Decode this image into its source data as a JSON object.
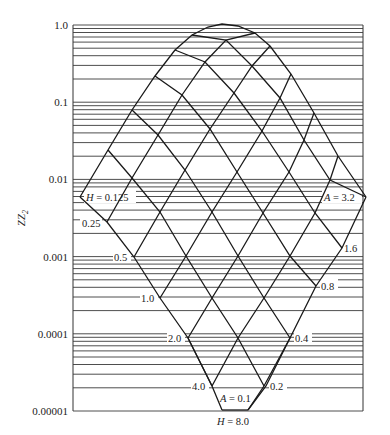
{
  "chart_data": {
    "type": "line",
    "title": "",
    "xlabel": "",
    "ylabel": "ZZ₂",
    "yscale": "log",
    "ylim": [
      1e-05,
      1.0
    ],
    "grid": true,
    "y_ticks": [
      "1.0",
      "0.1",
      "0.01",
      "0.001",
      "0.0001",
      "0.00001"
    ],
    "H_labels": [
      "H = 0.125",
      "0.25",
      "0.5",
      "1.0",
      "2.0",
      "4.0",
      "H = 8.0"
    ],
    "A_labels": [
      "A = 3.2",
      "1.6",
      "0.8",
      "0.4",
      "0.2",
      "A = 0.1"
    ],
    "families": [
      {
        "name": "H",
        "values": [
          0.125,
          0.25,
          0.5,
          1.0,
          2.0,
          4.0,
          8.0
        ]
      },
      {
        "name": "A",
        "values": [
          3.2,
          1.6,
          0.8,
          0.4,
          0.2,
          0.1
        ]
      }
    ],
    "annotations": [
      {
        "text": "H = 0.125",
        "at": "left tip, ZZ2 ≈ 0.006"
      },
      {
        "text": "A = 3.2",
        "at": "right tip, ZZ2 ≈ 0.006"
      },
      {
        "text": "A = 0.1",
        "at": "bottom, ZZ2 ≈ 0.00002"
      },
      {
        "text": "H = 8.0",
        "at": "bottom, below axis"
      }
    ],
    "envelope_peak": {
      "ZZ2": 1.0
    }
  },
  "axis": {
    "ylabel": "ZZ",
    "ylabel_sub": "2",
    "ticks": [
      {
        "label": "1.0",
        "y": 25
      },
      {
        "label": "0.1",
        "y": 102
      },
      {
        "label": "0.01",
        "y": 179
      },
      {
        "label": "0.001",
        "y": 257
      },
      {
        "label": "0.0001",
        "y": 334
      },
      {
        "label": "0.00001",
        "y": 411
      }
    ]
  },
  "labels": {
    "h0125": "H = 0.125",
    "h025": "0.25",
    "h05": "0.5",
    "h10": "1.0",
    "h20": "2.0",
    "h40": "4.0",
    "h80": "H = 8.0",
    "a32": "A = 3.2",
    "a16": "1.6",
    "a08": "0.8",
    "a04": "0.4",
    "a02": "0.2",
    "a01": "A = 0.1"
  },
  "colors": {
    "line": "#1a1a1a",
    "grid": "#3a3a3a",
    "text": "#222222"
  }
}
